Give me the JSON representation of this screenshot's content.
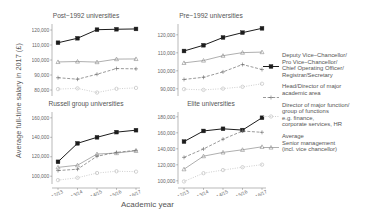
{
  "axes": {
    "ylabel": "Average full-time salary in 2017 (£)",
    "xlabel": "Academic year",
    "xticks": [
      "12/13",
      "13/14",
      "14/15",
      "15/16",
      "16/17"
    ]
  },
  "legend": [
    {
      "key": "solid-square-dark",
      "label": "Deputy Vice−Chancellor/\nPro Vice−Chancellor/\nChief Operating Officer/\nRegistrar/Secretary"
    },
    {
      "key": "dashed-plus-mid",
      "label": "Head/Director of major\nacademic area"
    },
    {
      "key": "dotted-circle-light",
      "label": "Director of major function/\ngroup of functions\ne.g. finance,\ncorporate services, HR"
    },
    {
      "key": "solid-triangle-mid",
      "label": "Average\nSenior management\n(incl. vice chancellor)"
    }
  ],
  "chart_data": {
    "type": "line",
    "title": "",
    "xlabel": "Academic year",
    "ylabel": "Average full-time salary in 2017 (£)",
    "x": [
      "12/13",
      "13/14",
      "14/15",
      "15/16",
      "16/17"
    ],
    "grid": false,
    "legend_position": "right",
    "panels": [
      {
        "title": "Post−1992 universities",
        "ylim": [
          76000,
          124000
        ],
        "yticks": [
          80000,
          90000,
          100000,
          110000,
          120000
        ],
        "yticklabels": [
          "80,000",
          "90,000",
          "100,000",
          "110,000",
          "120,000"
        ],
        "series": [
          {
            "name": "Deputy Vice−Chancellor/Pro Vice−Chancellor/Chief Operating Officer/Registrar/Secretary",
            "style": "solid-square-dark",
            "values": [
              111500,
              114500,
              120200,
              120500,
              120700
            ]
          },
          {
            "name": "Average Senior management (incl. vice chancellor)",
            "style": "solid-triangle-mid",
            "values": [
              98700,
              99000,
              98600,
              100600,
              100700
            ]
          },
          {
            "name": "Head/Director of major academic area",
            "style": "dashed-plus-mid",
            "values": [
              88200,
              87200,
              90500,
              94300,
              94100
            ]
          },
          {
            "name": "Director of major function/group of functions e.g. finance, corporate services, HR",
            "style": "dotted-circle-light",
            "values": [
              80600,
              81100,
              78300,
              80800,
              81400
            ]
          }
        ]
      },
      {
        "title": "Pre−1992 universities",
        "ylim": [
          86000,
          126000
        ],
        "yticks": [
          90000,
          100000,
          110000,
          120000
        ],
        "yticklabels": [
          "90,000",
          "100,000",
          "110,000",
          "120,000"
        ],
        "series": [
          {
            "name": "Deputy Vice−Chancellor/Pro Vice−Chancellor/Chief Operating Officer/Registrar/Secretary",
            "style": "solid-square-dark",
            "values": [
              111000,
              114200,
              118500,
              121200,
              123600
            ]
          },
          {
            "name": "Average Senior management (incl. vice chancellor)",
            "style": "solid-triangle-mid",
            "values": [
              104400,
              105700,
              108400,
              110100,
              110400
            ]
          },
          {
            "name": "Head/Director of major academic area",
            "style": "dashed-plus-mid",
            "values": [
              95200,
              96400,
              99400,
              103500,
              100700
            ]
          },
          {
            "name": "Director of major function/group of functions e.g. finance, corporate services, HR",
            "style": "dotted-circle-light",
            "values": [
              89800,
              89400,
              90100,
              91100,
              92800
            ]
          }
        ]
      },
      {
        "title": "Russell group universities",
        "ylim": [
          92000,
          166000
        ],
        "yticks": [
          100000,
          120000,
          140000,
          160000
        ],
        "yticklabels": [
          "100,000",
          "120,000",
          "140,000",
          "160,000"
        ],
        "series": [
          {
            "name": "Deputy Vice−Chancellor/Pro Vice−Chancellor/Chief Operating Officer/Registrar/Secretary",
            "style": "solid-square-dark",
            "values": [
              114800,
              133800,
              140000,
              145300,
              147300
            ]
          },
          {
            "name": "Average Senior management (incl. vice chancellor)",
            "style": "solid-triangle-mid",
            "values": [
              109100,
              111300,
              122800,
              123800,
              126100
            ]
          },
          {
            "name": "Head/Director of major academic area",
            "style": "dashed-plus-mid",
            "values": [
              105800,
              107200,
              120500,
              124500,
              126600
            ]
          },
          {
            "name": "Director of major function/group of functions e.g. finance, corporate services, HR",
            "style": "dotted-circle-light",
            "values": [
              96000,
              98400,
              103300,
              105100,
              104700
            ]
          }
        ]
      },
      {
        "title": "Elite universities",
        "ylim": [
          96000,
          186000
        ],
        "yticks": [
          100000,
          120000,
          140000,
          160000,
          180000
        ],
        "yticklabels": [
          "100,000",
          "120,000",
          "140,000",
          "160,000",
          "180,000"
        ],
        "series": [
          {
            "name": "Deputy Vice−Chancellor/Pro Vice−Chancellor/Chief Operating Officer/Registrar/Secretary",
            "style": "solid-square-dark",
            "values": [
              149000,
              162300,
              165000,
              163400,
              178800
            ]
          },
          {
            "name": "Head/Director of major academic area",
            "style": "dashed-plus-mid",
            "values": [
              129300,
              139800,
              152000,
              162200,
              160600
            ]
          },
          {
            "name": "Average Senior management (incl. vice chancellor)",
            "style": "solid-triangle-mid",
            "values": [
              114500,
              130800,
              135500,
              138800,
              142500
            ]
          },
          {
            "name": "Director of major function/group of functions e.g. finance, corporate services, HR",
            "style": "dotted-circle-light",
            "values": [
              99200,
              109500,
              113400,
              117000,
              120200
            ]
          }
        ]
      }
    ]
  }
}
